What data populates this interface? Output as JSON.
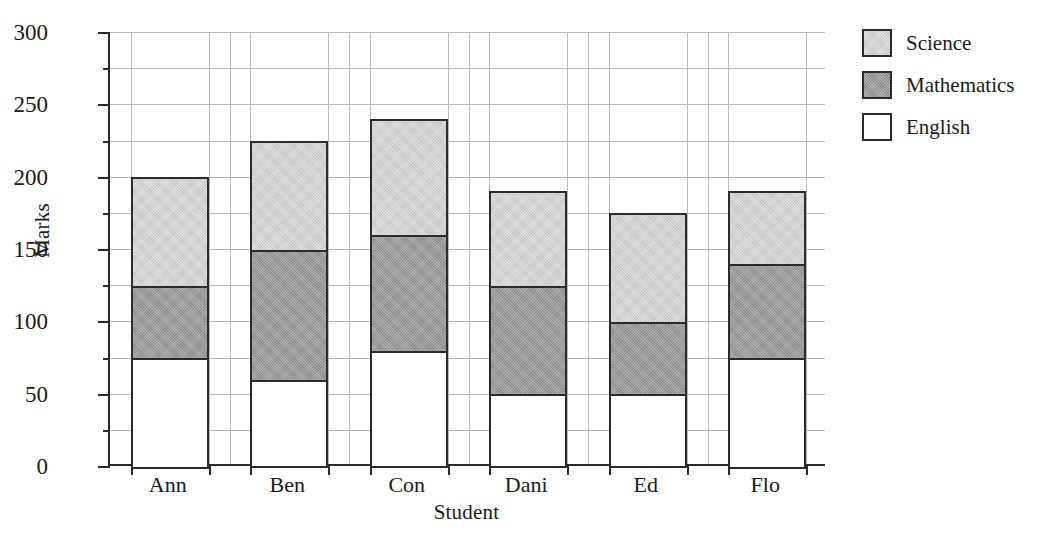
{
  "chart_data": {
    "type": "bar",
    "subtype": "stacked-bar",
    "title": "",
    "xlabel": "Student",
    "ylabel": "Marks",
    "categories": [
      "Ann",
      "Ben",
      "Con",
      "Dani",
      "Ed",
      "Flo"
    ],
    "series": [
      {
        "name": "English",
        "values": [
          75,
          60,
          80,
          50,
          50,
          75
        ],
        "color": "#ffffff"
      },
      {
        "name": "Mathematics",
        "values": [
          50,
          90,
          80,
          75,
          50,
          65
        ],
        "color": "#9a9a9a"
      },
      {
        "name": "Science",
        "values": [
          75,
          75,
          80,
          65,
          75,
          50
        ],
        "color": "#d3d3d3"
      }
    ],
    "stack_order_bottom_to_top": [
      "English",
      "Mathematics",
      "Science"
    ],
    "totals": [
      200,
      225,
      240,
      190,
      175,
      190
    ],
    "ylim": [
      0,
      300
    ],
    "y_major_ticks": [
      0,
      50,
      100,
      150,
      200,
      250,
      300
    ],
    "y_minor_ticks": [
      25,
      75,
      125,
      175,
      225,
      275
    ],
    "y_tick_labels": [
      "0",
      "50",
      "100",
      "150",
      "200",
      "250",
      "300"
    ],
    "grid": true,
    "grid_interval": 25,
    "legend_position": "right-top",
    "legend_entries": [
      {
        "label": "Science",
        "color": "#d3d3d3"
      },
      {
        "label": "Mathematics",
        "color": "#9a9a9a"
      },
      {
        "label": "English",
        "color": "#ffffff"
      }
    ]
  },
  "axes": {
    "y_title": "Marks",
    "x_title": "Student"
  },
  "colors": {
    "axis": "#2b2b2b",
    "grid": "#b9b9b9",
    "science": "#d3d3d3",
    "mathematics": "#9a9a9a",
    "english": "#ffffff",
    "background": "#ffffff"
  }
}
